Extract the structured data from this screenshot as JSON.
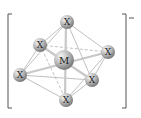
{
  "diagram": {
    "type": "octahedral complex ion",
    "central_atom": {
      "label": "M",
      "x": 64,
      "y": 60,
      "r": 10
    },
    "ligands": [
      {
        "id": "top",
        "label": "X",
        "x": 67,
        "y": 22
      },
      {
        "id": "upper-left",
        "label": "X",
        "x": 40,
        "y": 45
      },
      {
        "id": "right",
        "label": "X",
        "x": 108,
        "y": 52
      },
      {
        "id": "left",
        "label": "X",
        "x": 20,
        "y": 75
      },
      {
        "id": "lower-right",
        "label": "X",
        "x": 92,
        "y": 80
      },
      {
        "id": "bottom",
        "label": "X",
        "x": 66,
        "y": 100
      }
    ],
    "charge": "−",
    "colors": {
      "atom": "#a8a8a8",
      "highlight": "#f2f2f2",
      "bond": "#b0b0b0",
      "bracket": "#555555"
    }
  }
}
